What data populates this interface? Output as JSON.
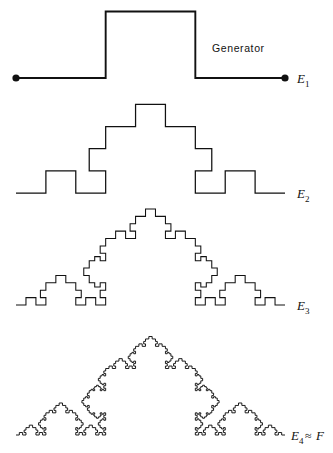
{
  "figure": {
    "background_color": "#ffffff",
    "stroke_color": "#111111",
    "width": 333,
    "height": 453
  },
  "annotations": {
    "generator_caption": "Generator",
    "generator_caption_x": 212,
    "generator_caption_y": 52
  },
  "labels": [
    {
      "name": "label-e1",
      "base": "E",
      "sub": "1",
      "rel": "",
      "extra": "",
      "x": 297,
      "y": 83
    },
    {
      "name": "label-e2",
      "base": "E",
      "sub": "2",
      "rel": "",
      "extra": "",
      "x": 297,
      "y": 198
    },
    {
      "name": "label-e3",
      "base": "E",
      "sub": "3",
      "rel": "",
      "extra": "",
      "x": 297,
      "y": 310
    },
    {
      "name": "label-e4",
      "base": "E",
      "sub": "4",
      "rel": "≈",
      "extra": "F",
      "x": 291,
      "y": 440
    }
  ],
  "chart_data": {
    "type": "line",
    "xlabel": "",
    "ylabel": "",
    "generator": {
      "description": "Unit segment replaced by 3 equal horizontal thirds with the middle third raised to form a square bump",
      "segments": 3,
      "bump_height_ratio": 0.7415,
      "left_flat_px": 89,
      "bump_width_px": 91,
      "right_flat_px": 89
    },
    "curves": [
      {
        "name": "E1",
        "iteration": 1,
        "x_start": 16,
        "x_end": 285,
        "baseline_y": 78,
        "top_y": 12,
        "has_endpoint_dots": true,
        "stroke_width": 1.9
      },
      {
        "name": "E2",
        "iteration": 2,
        "x_start": 16,
        "x_end": 285,
        "baseline_y": 193,
        "has_endpoint_dots": false,
        "stroke_width": 1.25
      },
      {
        "name": "E3",
        "iteration": 3,
        "x_start": 16,
        "x_end": 285,
        "baseline_y": 305,
        "has_endpoint_dots": false,
        "stroke_width": 1.05
      },
      {
        "name": "E4",
        "iteration": 4,
        "x_start": 16,
        "x_end": 285,
        "baseline_y": 435,
        "has_endpoint_dots": false,
        "stroke_width": 0.95
      }
    ],
    "endpoint_dots": [
      {
        "x": 16,
        "y": 78,
        "r": 3.6
      },
      {
        "x": 285,
        "y": 78,
        "r": 3.6
      }
    ],
    "generator_vertices_e1": [
      [
        16,
        78
      ],
      [
        105,
        78
      ],
      [
        105,
        12
      ],
      [
        196,
        12
      ],
      [
        196,
        78
      ],
      [
        285,
        78
      ]
    ]
  }
}
